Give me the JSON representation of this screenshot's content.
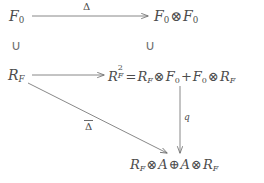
{
  "diagram": {
    "background_color": "#ffffff",
    "ink_color": "#4c4c4c",
    "nodes": {
      "top_left": {
        "id": "F0",
        "base": "F",
        "subscript": "0",
        "full_text": "F_0"
      },
      "top_right": {
        "id": "F0-tensor-F0",
        "left_base": "F",
        "left_sub": "0",
        "operator": "⊗",
        "right_base": "F",
        "right_sub": "0",
        "full_text": "F_0 ⊗ F_0"
      },
      "mid_left": {
        "id": "R-F",
        "base": "R",
        "subscript": "F",
        "full_text": "R_F"
      },
      "mid_right": {
        "id": "R2-F-equation",
        "lhs_base": "R",
        "lhs_sup": "2",
        "lhs_sub": "F",
        "equals": "=",
        "term1_a": "R",
        "term1_a_sub": "F",
        "term1_op": "⊗",
        "term1_b": "F",
        "term1_b_sub": "0",
        "plus": "+",
        "term2_a": "F",
        "term2_a_sub": "0",
        "term2_op": "⊗",
        "term2_b": "R",
        "term2_b_sub": "F",
        "full_text": "R^2_F = R_F ⊗ F_0 + F_0 ⊗ R_F"
      },
      "bottom": {
        "id": "R-F-tensor-A-oplus-A-tensor-R-F",
        "term1_a": "R",
        "term1_a_sub": "F",
        "term1_op": "⊗",
        "term1_b": "A",
        "oplus": "⊕",
        "term2_a": "A",
        "term2_op": "⊗",
        "term2_b": "R",
        "term2_b_sub": "F",
        "full_text": "R_F ⊗ A ⊕ A ⊗ R_F"
      }
    },
    "inclusions": {
      "left": {
        "symbol": "∪",
        "meaning": "inclusion-F0-over-RF"
      },
      "right": {
        "symbol": "∪",
        "meaning": "inclusion-F0F0-over-R2F"
      }
    },
    "arrows": {
      "top_horizontal": {
        "label": "Δ",
        "has_overbar": false,
        "from": "F_0",
        "to": "F_0 ⊗ F_0"
      },
      "mid_horizontal": {
        "label": "",
        "has_overbar": false,
        "from": "R_F",
        "to": "R^2_F"
      },
      "vertical_right": {
        "label": "q",
        "has_overbar": false,
        "from": "R^2_F",
        "to": "R_F ⊗ A ⊕ A ⊗ R_F"
      },
      "diagonal": {
        "label": "Δ",
        "has_overbar": true,
        "from": "R_F",
        "to": "R_F ⊗ A ⊕ A ⊕ R_F"
      }
    }
  }
}
